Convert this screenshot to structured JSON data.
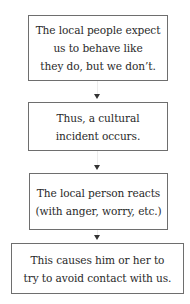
{
  "diagram": {
    "type": "flowchart",
    "direction": "top-to-bottom",
    "steps": [
      {
        "lines": [
          "The local people expect",
          "us to behave like",
          "they do, but we don’t."
        ]
      },
      {
        "lines": [
          "Thus, a cultural",
          "incident occurs."
        ]
      },
      {
        "lines": [
          "The local person reacts",
          "(with anger, worry, etc.)"
        ]
      },
      {
        "lines": [
          "This causes him or her to",
          "try to avoid contact with us."
        ]
      }
    ],
    "arrow_icon": "down-triangle-arrow-icon"
  }
}
